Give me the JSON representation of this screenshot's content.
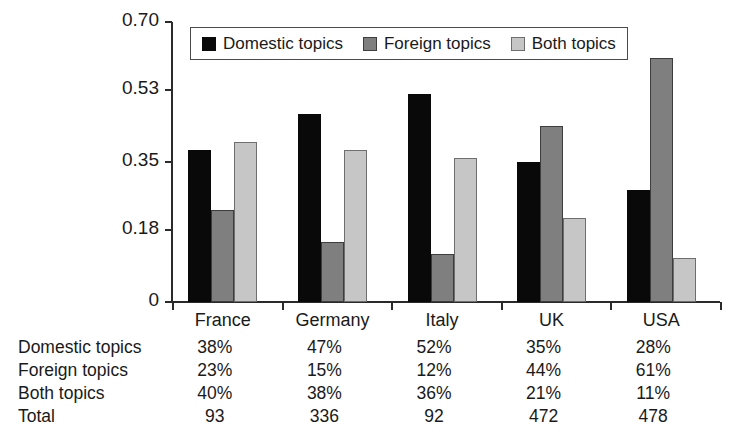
{
  "chart_data": {
    "type": "bar",
    "title": "",
    "subtitle": "",
    "xlabel": "",
    "ylabel": "",
    "categories": [
      "France",
      "Germany",
      "Italy",
      "UK",
      "USA"
    ],
    "series": [
      {
        "name": "Domestic topics",
        "color": "#090909",
        "values": [
          0.38,
          0.47,
          0.52,
          0.35,
          0.28
        ]
      },
      {
        "name": "Foreign topics",
        "color": "#7f7f7f",
        "values": [
          0.23,
          0.15,
          0.12,
          0.44,
          0.61
        ]
      },
      {
        "name": "Both topics",
        "color": "#c6c6c6",
        "values": [
          0.4,
          0.38,
          0.36,
          0.21,
          0.11
        ]
      }
    ],
    "ylim": [
      0,
      0.7
    ],
    "yticks": [
      0,
      0.18,
      0.35,
      0.53,
      0.7
    ],
    "ytick_labels": [
      "0",
      "0.18",
      "0.35",
      "0.53",
      "0.70"
    ],
    "grid": false,
    "legend_position": "top-left-inside",
    "annotations": []
  },
  "legend": {
    "items": [
      {
        "label": "Domestic topics",
        "swatch": "black-square-icon"
      },
      {
        "label": "Foreign topics",
        "swatch": "dark-gray-square-icon"
      },
      {
        "label": "Both topics",
        "swatch": "light-gray-square-icon"
      }
    ]
  },
  "axis": {
    "y_labels": [
      "0.70",
      "0.53",
      "0.35",
      "0.18",
      "0"
    ],
    "x_labels": [
      "France",
      "Germany",
      "Italy",
      "UK",
      "USA"
    ]
  },
  "table": {
    "row_labels": [
      "Domestic topics",
      "Foreign topics",
      "Both topics",
      "Total"
    ],
    "columns": [
      "France",
      "Germany",
      "Italy",
      "UK",
      "USA"
    ],
    "rows": [
      {
        "label": "Domestic topics",
        "values": [
          "38%",
          "47%",
          "52%",
          "35%",
          "28%"
        ]
      },
      {
        "label": "Foreign topics",
        "values": [
          "23%",
          "15%",
          "12%",
          "44%",
          "61%"
        ]
      },
      {
        "label": "Both topics",
        "values": [
          "40%",
          "38%",
          "36%",
          "21%",
          "11%"
        ]
      },
      {
        "label": "Total",
        "values": [
          "93",
          "336",
          "92",
          "472",
          "478"
        ]
      }
    ]
  }
}
